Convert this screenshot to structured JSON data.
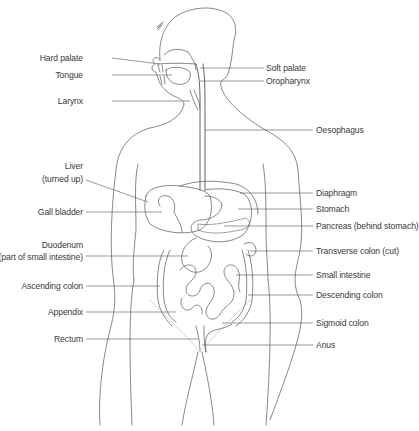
{
  "diagram": {
    "line_color": "#555555",
    "text_color": "#3a3a3a",
    "labels_left": [
      {
        "id": "hard-palate",
        "text": "Hard palate",
        "x": 83,
        "y": 53
      },
      {
        "id": "tongue",
        "text": "Tongue",
        "x": 83,
        "y": 70
      },
      {
        "id": "larynx",
        "text": "Larynx",
        "x": 83,
        "y": 96
      },
      {
        "id": "liver",
        "text": "Liver",
        "x": 83,
        "y": 161
      },
      {
        "id": "liver-note",
        "text": "(turned up)",
        "x": 83,
        "y": 174
      },
      {
        "id": "gall-bladder",
        "text": "Gall bladder",
        "x": 83,
        "y": 207
      },
      {
        "id": "duodenum",
        "text": "Duodenum",
        "x": 83,
        "y": 240
      },
      {
        "id": "duodenum-note",
        "text": "(part of  small intestine)",
        "x": 83,
        "y": 252
      },
      {
        "id": "ascending-colon",
        "text": "Ascending colon",
        "x": 83,
        "y": 281
      },
      {
        "id": "appendix",
        "text": "Appendix",
        "x": 83,
        "y": 307
      },
      {
        "id": "rectum",
        "text": "Rectum",
        "x": 83,
        "y": 334
      }
    ],
    "labels_right": [
      {
        "id": "soft-palate",
        "text": "Soft palate",
        "x": 266,
        "y": 63
      },
      {
        "id": "oropharynx",
        "text": "Oropharynx",
        "x": 266,
        "y": 76
      },
      {
        "id": "oesophagus",
        "text": "Oesophagus",
        "x": 316,
        "y": 125
      },
      {
        "id": "diaphragm",
        "text": "Diaphragm",
        "x": 316,
        "y": 188
      },
      {
        "id": "stomach",
        "text": "Stomach",
        "x": 316,
        "y": 204
      },
      {
        "id": "pancreas",
        "text": "Pancreas (behind stomach)",
        "x": 316,
        "y": 221
      },
      {
        "id": "transverse-colon",
        "text": "Transverse colon (cut)",
        "x": 316,
        "y": 246
      },
      {
        "id": "small-intestine",
        "text": "Small intestine",
        "x": 316,
        "y": 270
      },
      {
        "id": "descending-colon",
        "text": "Descending colon",
        "x": 316,
        "y": 290
      },
      {
        "id": "sigmoid-colon",
        "text": "Sigmoid colon",
        "x": 316,
        "y": 318
      },
      {
        "id": "anus",
        "text": "Anus",
        "x": 316,
        "y": 340
      }
    ]
  }
}
